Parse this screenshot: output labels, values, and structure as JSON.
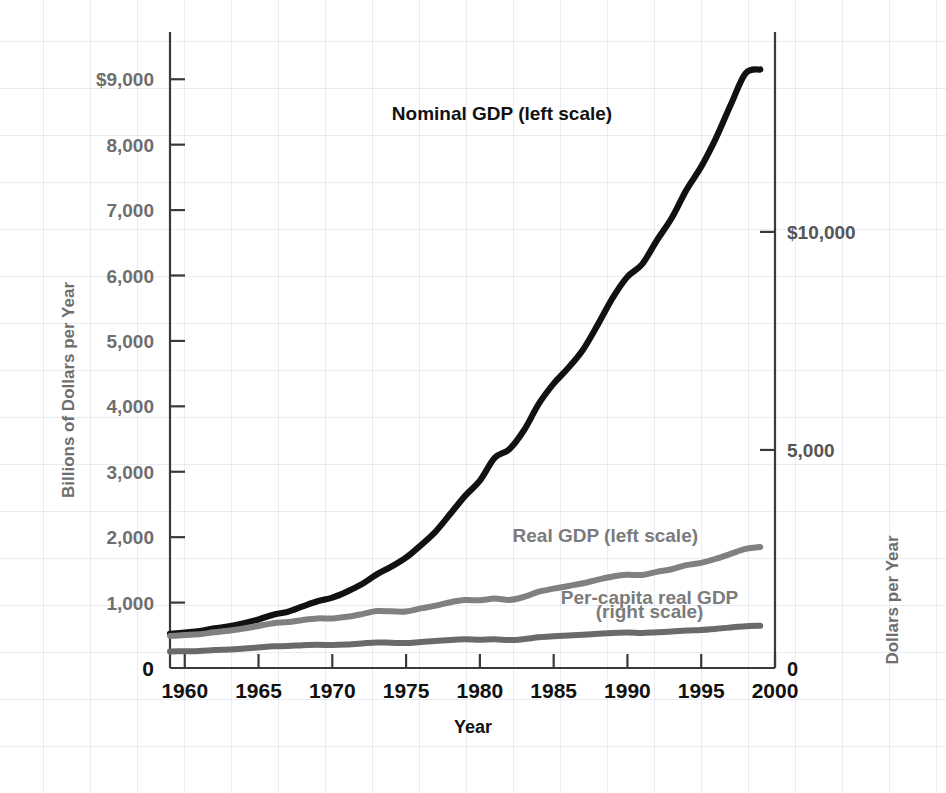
{
  "chart_data": {
    "type": "line",
    "title": "",
    "xlabel": "Year",
    "ylabel": "Billions of Dollars per Year",
    "ylabel_right": "Dollars per Year",
    "xlim": [
      1959,
      2000
    ],
    "ylim": [
      0,
      9600
    ],
    "ylim_right": [
      0,
      14400
    ],
    "grid": true,
    "legend_position": "inline-annotations",
    "x_ticks": [
      "1960",
      "1965",
      "1970",
      "1975",
      "1980",
      "1985",
      "1990",
      "1995",
      "2000"
    ],
    "x_tick_values": [
      1960,
      1965,
      1970,
      1975,
      1980,
      1985,
      1990,
      1995,
      2000
    ],
    "y_ticks_left": [
      "0",
      "1,000",
      "2,000",
      "3,000",
      "4,000",
      "5,000",
      "6,000",
      "7,000",
      "8,000",
      "$9,000"
    ],
    "y_tick_values_left": [
      0,
      1000,
      2000,
      3000,
      4000,
      5000,
      6000,
      7000,
      8000,
      9000
    ],
    "y_ticks_right": [
      "0",
      "5,000",
      "$10,000"
    ],
    "y_tick_values_right": [
      0,
      5000,
      10000
    ],
    "annotations": [
      {
        "text": "Nominal GDP (left scale)",
        "x": 1981.5,
        "y": 8380
      },
      {
        "text": "Real GDP (left scale)",
        "x": 1988.5,
        "y": 1930
      },
      {
        "text": "Per-capita real GDP",
        "x": 1991.5,
        "y": 980
      },
      {
        "text": "(right scale)",
        "x": 1991.5,
        "y": 770
      }
    ],
    "x": [
      1959,
      1960,
      1961,
      1962,
      1963,
      1964,
      1965,
      1966,
      1967,
      1968,
      1969,
      1970,
      1971,
      1972,
      1973,
      1974,
      1975,
      1976,
      1977,
      1978,
      1979,
      1980,
      1981,
      1982,
      1983,
      1984,
      1985,
      1986,
      1987,
      1988,
      1989,
      1990,
      1991,
      1992,
      1993,
      1994,
      1995,
      1996,
      1997,
      1998,
      1999
    ],
    "series": [
      {
        "name": "Nominal GDP (left scale)",
        "scale": "left",
        "units": "Billions of Dollars per Year",
        "color": "#111111",
        "values": [
          522,
          542,
          563,
          605,
          638,
          685,
          743,
          815,
          861,
          943,
          1020,
          1076,
          1168,
          1282,
          1429,
          1549,
          1689,
          1877,
          2086,
          2357,
          2632,
          2863,
          3211,
          3345,
          3638,
          4041,
          4347,
          4590,
          4870,
          5253,
          5658,
          5980,
          6174,
          6539,
          6879,
          7309,
          7664,
          8100,
          8609,
          9089,
          9150
        ]
      },
      {
        "name": "Real GDP (left scale)",
        "scale": "left",
        "units": "Billions of Dollars per Year",
        "color": "#808080",
        "values": [
          490,
          503,
          516,
          547,
          571,
          604,
          643,
          685,
          702,
          735,
          758,
          757,
          782,
          823,
          870,
          866,
          864,
          911,
          953,
          1006,
          1038,
          1035,
          1061,
          1040,
          1087,
          1166,
          1213,
          1254,
          1296,
          1350,
          1399,
          1425,
          1422,
          1470,
          1510,
          1572,
          1608,
          1670,
          1745,
          1820,
          1850
        ]
      },
      {
        "name": "Per-capita real GDP (right scale)",
        "scale": "right",
        "units": "Dollars per Year",
        "color": "#6a6a6a",
        "values": [
          380,
          385,
          392,
          412,
          425,
          446,
          470,
          497,
          504,
          523,
          533,
          527,
          538,
          561,
          587,
          578,
          572,
          597,
          618,
          644,
          658,
          650,
          660,
          640,
          663,
          705,
          726,
          743,
          761,
          784,
          805,
          812,
          802,
          821,
          835,
          860,
          873,
          898,
          929,
          958,
          970
        ]
      }
    ]
  },
  "axes": {
    "left_title": "Billions of Dollars per Year",
    "right_title": "Dollars per Year",
    "bottom_title": "Year"
  }
}
